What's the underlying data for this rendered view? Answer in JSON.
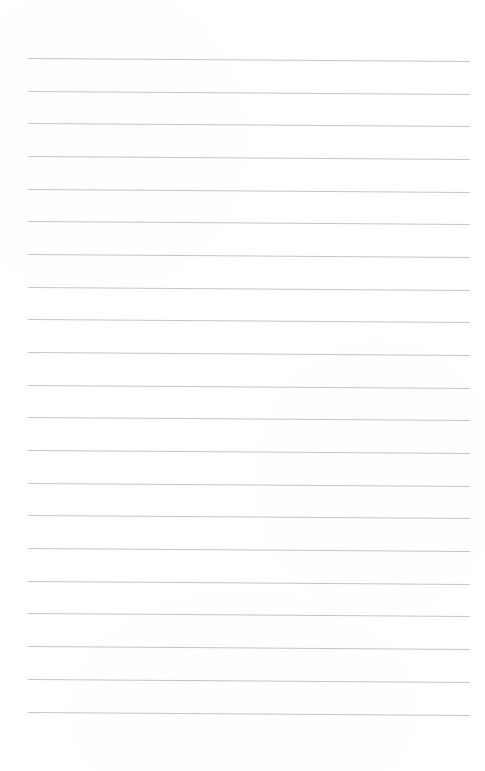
{
  "document": {
    "kind": "lined-paper-sheet",
    "title": "Blank Ruled Notebook Page",
    "content_text": "",
    "page_width": 485,
    "page_height": 771,
    "background_color": "#ffffff",
    "is_blank": "true"
  },
  "ruling": {
    "line_color": "#b9bbbe",
    "line_thickness_px": 1,
    "line_count": 21,
    "first_line_y": 58,
    "line_spacing_px": 32.7,
    "line_start_x": 28,
    "line_end_x": 470,
    "line_length_px": 442,
    "slope_drop_px": 3.5,
    "skew_note": "lines slope very slightly downward left to right",
    "lines": [
      {
        "index": 1,
        "y_left": 58,
        "y_right": 61
      },
      {
        "index": 2,
        "y_left": 91,
        "y_right": 94
      },
      {
        "index": 3,
        "y_left": 123,
        "y_right": 126
      },
      {
        "index": 4,
        "y_left": 156,
        "y_right": 159
      },
      {
        "index": 5,
        "y_left": 189,
        "y_right": 192
      },
      {
        "index": 6,
        "y_left": 221,
        "y_right": 224
      },
      {
        "index": 7,
        "y_left": 254,
        "y_right": 257
      },
      {
        "index": 8,
        "y_left": 287,
        "y_right": 290
      },
      {
        "index": 9,
        "y_left": 319,
        "y_right": 322
      },
      {
        "index": 10,
        "y_left": 352,
        "y_right": 355
      },
      {
        "index": 11,
        "y_left": 385,
        "y_right": 388
      },
      {
        "index": 12,
        "y_left": 417,
        "y_right": 420
      },
      {
        "index": 13,
        "y_left": 450,
        "y_right": 453
      },
      {
        "index": 14,
        "y_left": 483,
        "y_right": 486
      },
      {
        "index": 15,
        "y_left": 515,
        "y_right": 518
      },
      {
        "index": 16,
        "y_left": 548,
        "y_right": 551
      },
      {
        "index": 17,
        "y_left": 581,
        "y_right": 584
      },
      {
        "index": 18,
        "y_left": 613,
        "y_right": 616
      },
      {
        "index": 19,
        "y_left": 646,
        "y_right": 649
      },
      {
        "index": 20,
        "y_left": 679,
        "y_right": 682
      },
      {
        "index": 21,
        "y_left": 712,
        "y_right": 715
      }
    ]
  },
  "margins": {
    "top_px": 58,
    "bottom_px": 56,
    "left_px": 28,
    "right_px": 15,
    "has_vertical_margin_rule": "false"
  }
}
